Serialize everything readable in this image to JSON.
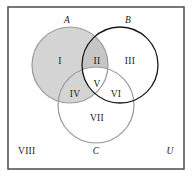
{
  "figure": {
    "name": "three-set-venn-diagram",
    "background_color": "#ffffff",
    "frame": {
      "label": "universal-set-rectangle",
      "stroke_color": "#555555",
      "fill_color": "#ffffff",
      "x": 8,
      "y": 7,
      "width": 176,
      "height": 162,
      "stroke_width": 1.6
    }
  },
  "sets": [
    {
      "id": "A",
      "label": "A",
      "label_x": 67,
      "label_y": 21,
      "cx": 70,
      "cy": 65,
      "r": 38,
      "stroke_color": "#9a9a9a",
      "fill_color": "#d4d4d4",
      "shaded": true
    },
    {
      "id": "B",
      "label": "B",
      "label_x": 128,
      "label_y": 21,
      "cx": 120,
      "cy": 65,
      "r": 38,
      "stroke_color": "#1a1a1a",
      "fill_color": "none",
      "shaded": false
    },
    {
      "id": "C",
      "label": "C",
      "label_x": 96,
      "label_y": 152,
      "cx": 96,
      "cy": 105,
      "r": 38,
      "stroke_color": "#9a9a9a",
      "fill_color": "none",
      "shaded": false
    }
  ],
  "regions": [
    {
      "id": "I",
      "label": "I",
      "x": 60,
      "y": 62,
      "description": "A only",
      "shaded": true,
      "fill_color": "#d4d4d4"
    },
    {
      "id": "II",
      "label": "II",
      "x": 97,
      "y": 62,
      "description": "A and B only",
      "shaded": true,
      "fill_color": "#c6c6c6"
    },
    {
      "id": "III",
      "label": "III",
      "x": 130,
      "y": 62,
      "description": "B only",
      "shaded": false,
      "fill_color": "#ffffff"
    },
    {
      "id": "IV",
      "label": "IV",
      "x": 75,
      "y": 95,
      "description": "A and C only",
      "shaded": true,
      "fill_color": "#d4d4d4"
    },
    {
      "id": "V",
      "label": "V",
      "x": 97,
      "y": 85,
      "description": "A and B and C",
      "shaded": false,
      "fill_color": "#ffffff"
    },
    {
      "id": "VI",
      "label": "VI",
      "x": 116,
      "y": 95,
      "description": "B and C only",
      "shaded": false,
      "fill_color": "#ffffff"
    },
    {
      "id": "VII",
      "label": "VII",
      "x": 97,
      "y": 119,
      "description": "C only",
      "shaded": false,
      "fill_color": "#ffffff"
    }
  ],
  "corner_labels": [
    {
      "id": "VIII",
      "label": "VIII",
      "x": 18,
      "y": 152,
      "description": "outside all sets",
      "italic": false
    },
    {
      "id": "U",
      "label": "U",
      "x": 170,
      "y": 152,
      "description": "universal set",
      "italic": true
    }
  ],
  "colors": {
    "shade_light": "#d4d4d4",
    "shade_overlap": "#c6c6c6",
    "stroke_dark": "#1a1a1a",
    "stroke_light": "#9a9a9a",
    "frame": "#555555",
    "text": "#1a1a1a"
  }
}
